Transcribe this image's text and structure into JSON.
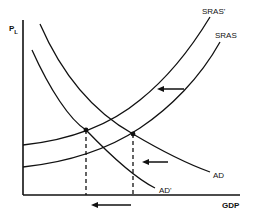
{
  "diagram": {
    "title_fragment": "",
    "y_axis_label": "P",
    "y_axis_subscript": "L",
    "x_axis_label": "GDP",
    "curves": [
      {
        "name": "SRAS'",
        "label": "SRAS'"
      },
      {
        "name": "SRAS",
        "label": "SRAS"
      },
      {
        "name": "AD",
        "label": "AD"
      },
      {
        "name": "AD'",
        "label": "AD'"
      }
    ],
    "arrows": [
      {
        "description": "SRAS shifts left to SRAS'",
        "direction": "left"
      },
      {
        "description": "AD shifts left to AD'",
        "direction": "left"
      },
      {
        "description": "GDP decreases",
        "direction": "left"
      }
    ],
    "equilibrium_points": [
      {
        "description": "SRAS' and AD' intersection"
      },
      {
        "description": "SRAS and AD intersection"
      }
    ]
  }
}
